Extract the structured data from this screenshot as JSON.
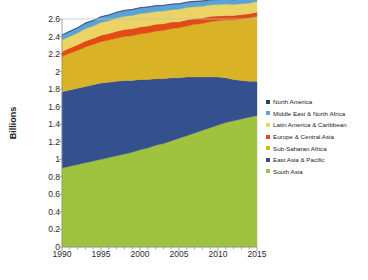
{
  "chart_data": {
    "type": "area",
    "stacked": true,
    "title": "",
    "subtitle": "",
    "xlabel": "",
    "ylabel": "Billions",
    "xlim": [
      1990,
      2015
    ],
    "ylim": [
      0,
      2.6
    ],
    "grid": false,
    "legend_position": "right",
    "y_ticks": [
      "0",
      "0.2",
      "0.4",
      "0.6",
      "0.8",
      "1",
      "1.2",
      "1.4",
      "1.6",
      "1.8",
      "2",
      "2.2",
      "2.4",
      "2.6"
    ],
    "y_tick_values": [
      0,
      0.2,
      0.4,
      0.6,
      0.8,
      1.0,
      1.2,
      1.4,
      1.6,
      1.8,
      2.0,
      2.2,
      2.4,
      2.6
    ],
    "x_ticks": [
      "1990",
      "1995",
      "2000",
      "2005",
      "2010",
      "2015"
    ],
    "x_tick_values": [
      1990,
      1995,
      2000,
      2005,
      2010,
      2015
    ],
    "x": [
      1990,
      1991,
      1992,
      1993,
      1994,
      1995,
      1996,
      1997,
      1998,
      1999,
      2000,
      2001,
      2002,
      2003,
      2004,
      2005,
      2006,
      2007,
      2008,
      2009,
      2010,
      2011,
      2012,
      2013,
      2014,
      2015
    ],
    "series": [
      {
        "name": "South Asia",
        "color": "#9fc33e",
        "stack_order": 1,
        "values": [
          0.9,
          0.92,
          0.94,
          0.96,
          0.98,
          1.0,
          1.02,
          1.04,
          1.06,
          1.08,
          1.11,
          1.13,
          1.16,
          1.18,
          1.21,
          1.24,
          1.27,
          1.3,
          1.33,
          1.36,
          1.39,
          1.42,
          1.44,
          1.46,
          1.48,
          1.5
        ]
      },
      {
        "name": "East Asia & Pacific",
        "color": "#34508f",
        "stack_order": 2,
        "values": [
          0.87,
          0.87,
          0.87,
          0.87,
          0.87,
          0.87,
          0.86,
          0.85,
          0.84,
          0.82,
          0.8,
          0.78,
          0.76,
          0.74,
          0.72,
          0.69,
          0.67,
          0.64,
          0.61,
          0.58,
          0.55,
          0.51,
          0.47,
          0.44,
          0.41,
          0.39
        ]
      },
      {
        "name": "Sub-Saharan Africa",
        "color": "#d9b226",
        "stack_order": 3,
        "values": [
          0.4,
          0.42,
          0.43,
          0.45,
          0.46,
          0.47,
          0.48,
          0.49,
          0.5,
          0.51,
          0.52,
          0.53,
          0.54,
          0.55,
          0.56,
          0.57,
          0.58,
          0.6,
          0.61,
          0.63,
          0.64,
          0.66,
          0.68,
          0.7,
          0.72,
          0.74
        ]
      },
      {
        "name": "Europe & Central Asia",
        "color": "#e24b16",
        "stack_order": 4,
        "values": [
          0.06,
          0.06,
          0.065,
          0.07,
          0.07,
          0.075,
          0.075,
          0.08,
          0.08,
          0.08,
          0.08,
          0.08,
          0.08,
          0.075,
          0.075,
          0.07,
          0.07,
          0.065,
          0.06,
          0.06,
          0.055,
          0.05,
          0.05,
          0.05,
          0.05,
          0.05
        ]
      },
      {
        "name": "Latin America & Caribbean",
        "color": "#ebd464",
        "stack_order": 5,
        "values": [
          0.13,
          0.13,
          0.135,
          0.14,
          0.14,
          0.145,
          0.145,
          0.15,
          0.15,
          0.15,
          0.15,
          0.15,
          0.145,
          0.145,
          0.14,
          0.14,
          0.14,
          0.135,
          0.135,
          0.13,
          0.13,
          0.13,
          0.125,
          0.125,
          0.12,
          0.12
        ]
      },
      {
        "name": "Middle East & North Africa",
        "color": "#5ba3d6",
        "stack_order": 6,
        "values": [
          0.055,
          0.056,
          0.058,
          0.06,
          0.061,
          0.062,
          0.063,
          0.064,
          0.065,
          0.065,
          0.065,
          0.064,
          0.063,
          0.062,
          0.061,
          0.06,
          0.059,
          0.058,
          0.057,
          0.056,
          0.055,
          0.054,
          0.053,
          0.052,
          0.051,
          0.05
        ]
      },
      {
        "name": "North America",
        "color": "#2b3f6b",
        "stack_order": 7,
        "values": [
          0.006,
          0.006,
          0.006,
          0.006,
          0.006,
          0.006,
          0.006,
          0.006,
          0.006,
          0.006,
          0.006,
          0.006,
          0.006,
          0.006,
          0.006,
          0.006,
          0.006,
          0.006,
          0.006,
          0.006,
          0.006,
          0.006,
          0.006,
          0.006,
          0.006,
          0.006
        ]
      }
    ],
    "legend_order": [
      "North America",
      "Middle East & North Africa",
      "Latin America & Caribbean",
      "Europe & Central Asia",
      "Sub-Saharan Africa",
      "East Asia & Pacific",
      "South Asia"
    ]
  },
  "legend": {
    "items": [
      {
        "label": "North America",
        "color": "#2b3f6b"
      },
      {
        "label": "Middle East & North Africa",
        "color": "#5ba3d6"
      },
      {
        "label": "Latin America & Caribbean",
        "color": "#ebd464"
      },
      {
        "label": "Europe & Central Asia",
        "color": "#e24b16"
      },
      {
        "label": "Sub-Saharan Africa",
        "color": "#d9b226"
      },
      {
        "label": "East Asia & Pacific",
        "color": "#34508f"
      },
      {
        "label": "South Asia",
        "color": "#9fc33e"
      }
    ]
  },
  "axes": {
    "y_title": "Billions"
  }
}
